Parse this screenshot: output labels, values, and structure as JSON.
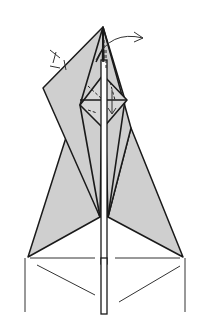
{
  "diagram": {
    "colors": {
      "paper": "#cfcfcf",
      "line": "#1a1a1a",
      "background": "#ffffff"
    },
    "symbols": [
      {
        "name": "fold-behind-arrow",
        "description": "curved arrow at top right indicating fold"
      },
      {
        "name": "pleat-marks",
        "description": "valley/mountain tick marks on left upper edge"
      },
      {
        "name": "fold-down-arrow",
        "description": "small arrow in central diamond pointing down"
      }
    ]
  }
}
